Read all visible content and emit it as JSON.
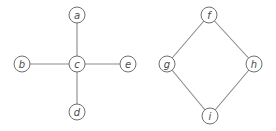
{
  "colors": {
    "edge": "#8a8a8a",
    "node_stroke": "#6f6f6f",
    "label": "#4a4a4a",
    "background": "#ffffff"
  },
  "graphs": [
    {
      "name": "star-graph",
      "nodes": [
        {
          "id": "a",
          "label": "a",
          "x": 77,
          "y": 15
        },
        {
          "id": "b",
          "label": "b",
          "x": 22,
          "y": 64
        },
        {
          "id": "c",
          "label": "c",
          "x": 77,
          "y": 64
        },
        {
          "id": "e",
          "label": "e",
          "x": 128,
          "y": 64
        },
        {
          "id": "d",
          "label": "d",
          "x": 77,
          "y": 112
        }
      ],
      "edges": [
        [
          "c",
          "a"
        ],
        [
          "c",
          "b"
        ],
        [
          "c",
          "e"
        ],
        [
          "c",
          "d"
        ]
      ]
    },
    {
      "name": "cycle-graph",
      "nodes": [
        {
          "id": "f",
          "label": "f",
          "x": 209,
          "y": 15
        },
        {
          "id": "g",
          "label": "g",
          "x": 167,
          "y": 64
        },
        {
          "id": "h",
          "label": "h",
          "x": 254,
          "y": 64
        },
        {
          "id": "i",
          "label": "i",
          "x": 210,
          "y": 116
        }
      ],
      "edges": [
        [
          "f",
          "g"
        ],
        [
          "f",
          "h"
        ],
        [
          "g",
          "i"
        ],
        [
          "h",
          "i"
        ]
      ]
    }
  ]
}
